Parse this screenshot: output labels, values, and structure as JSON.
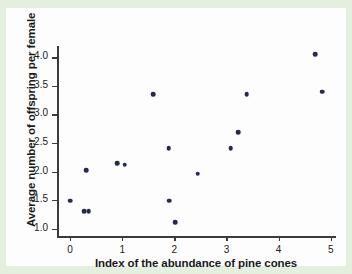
{
  "chart_data": {
    "type": "scatter",
    "title": "",
    "xlabel": "Index of the abundance of pine cones",
    "ylabel": "Average number of offspring per female",
    "xlim": [
      -0.25,
      5.1
    ],
    "ylim": [
      0.87,
      4.2
    ],
    "xticks": [
      "0",
      "1",
      "2",
      "3",
      "4",
      "5"
    ],
    "xtick_values": [
      0,
      1,
      2,
      3,
      4,
      5
    ],
    "yticks": [
      "1.0",
      "1.5",
      "2.0",
      "2.5",
      "3.0",
      "3.5",
      "4.0"
    ],
    "ytick_values": [
      1.0,
      1.5,
      2.0,
      2.5,
      3.0,
      3.5,
      4.0
    ],
    "grid": false,
    "legend": null,
    "marker_color": "#252a52",
    "points": [
      {
        "x": 0.0,
        "y": 1.49
      },
      {
        "x": 0.27,
        "y": 1.3
      },
      {
        "x": 0.36,
        "y": 1.3
      },
      {
        "x": 0.31,
        "y": 2.02
      },
      {
        "x": 0.9,
        "y": 2.15
      },
      {
        "x": 1.05,
        "y": 2.12
      },
      {
        "x": 1.6,
        "y": 3.35
      },
      {
        "x": 1.89,
        "y": 2.41
      },
      {
        "x": 1.9,
        "y": 1.49
      },
      {
        "x": 2.02,
        "y": 1.11
      },
      {
        "x": 2.45,
        "y": 1.96
      },
      {
        "x": 3.08,
        "y": 2.41
      },
      {
        "x": 3.22,
        "y": 2.69
      },
      {
        "x": 3.39,
        "y": 3.35
      },
      {
        "x": 4.7,
        "y": 4.06
      },
      {
        "x": 4.83,
        "y": 3.4
      }
    ]
  },
  "colors": {
    "background": "#e3f0de",
    "paper": "#fdfdfd",
    "axis": "#3b3b3b",
    "marker": "#252a52",
    "text": "#1a1a1a"
  }
}
